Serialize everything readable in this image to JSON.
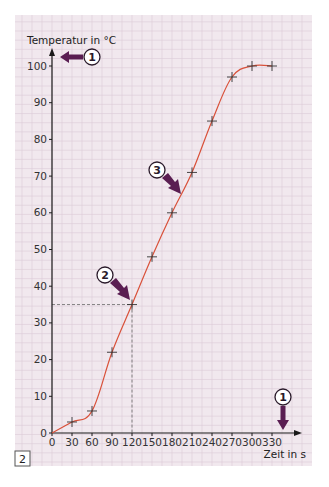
{
  "chart_data": {
    "type": "line",
    "title": "",
    "xlabel": "Zeit in s",
    "ylabel": "Temperatur in °C",
    "xlim": [
      0,
      330
    ],
    "ylim": [
      0,
      100
    ],
    "x_ticks": [
      0,
      30,
      60,
      90,
      120,
      150,
      180,
      210,
      240,
      270,
      300,
      330
    ],
    "y_ticks": [
      0,
      10,
      20,
      30,
      40,
      50,
      60,
      70,
      80,
      90,
      100
    ],
    "grid": true,
    "series": [
      {
        "name": "Temperatur",
        "color": "#d9513a",
        "marker": "plus",
        "x": [
          0,
          30,
          60,
          90,
          120,
          150,
          180,
          210,
          240,
          270,
          300,
          330
        ],
        "y": [
          0,
          3,
          6,
          22,
          35,
          48,
          60,
          71,
          85,
          97,
          100,
          100
        ]
      }
    ],
    "guide_lines": [
      {
        "type": "dashed",
        "x": 120,
        "y": 35
      }
    ],
    "annotations": [
      {
        "label": "1",
        "target": "y-axis",
        "direction": "left"
      },
      {
        "label": "1",
        "target": "x-axis",
        "direction": "down"
      },
      {
        "label": "2",
        "target_point": [
          120,
          35
        ]
      },
      {
        "label": "3",
        "target_point": [
          195,
          66
        ]
      }
    ],
    "figure_label": "2",
    "colors": {
      "background": "#f1e8ee",
      "grid": "#dccbd6",
      "axis": "#1a1a1a",
      "line": "#d9513a",
      "arrow": "#5a1e52"
    }
  }
}
